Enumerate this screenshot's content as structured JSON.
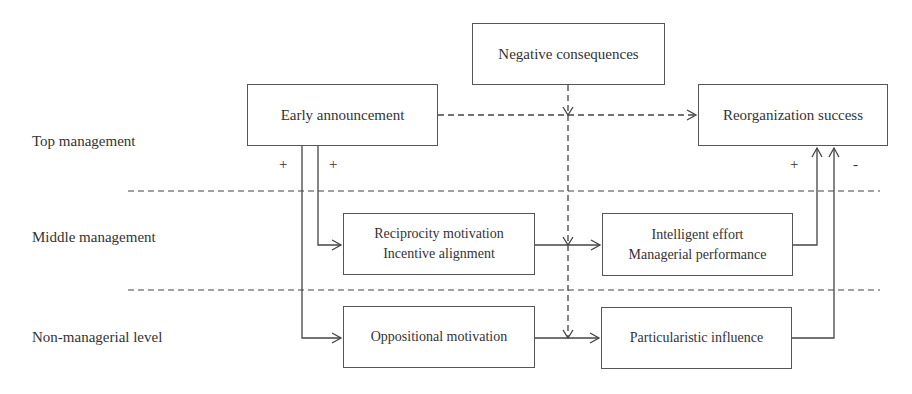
{
  "levels": {
    "top": "Top management",
    "middle": "Middle management",
    "non_managerial": "Non-managerial level"
  },
  "nodes": {
    "negative_consequences": {
      "line1": "Negative consequences"
    },
    "early_announcement": {
      "line1": "Early announcement"
    },
    "reorganization_success": {
      "line1": "Reorganization success"
    },
    "reciprocity": {
      "line1": "Reciprocity motivation",
      "line2": "Incentive alignment"
    },
    "intelligent_effort": {
      "line1": "Intelligent effort",
      "line2": "Managerial performance"
    },
    "oppositional": {
      "line1": "Oppositional motivation"
    },
    "particularistic": {
      "line1": "Particularistic influence"
    }
  },
  "signs": {
    "early_to_nonmanagerial": "+",
    "early_to_middle": "+",
    "intelligent_to_success": "+",
    "particularistic_to_success": "-"
  },
  "edges": [
    {
      "from": "early_announcement",
      "to": "reorganization_success",
      "style": "dashed"
    },
    {
      "from": "negative_consequences",
      "to": "moderates all horizontal links",
      "style": "dashed"
    },
    {
      "from": "early_announcement",
      "to": "reciprocity",
      "sign": "+"
    },
    {
      "from": "early_announcement",
      "to": "oppositional",
      "sign": "+"
    },
    {
      "from": "reciprocity",
      "to": "intelligent_effort"
    },
    {
      "from": "oppositional",
      "to": "particularistic"
    },
    {
      "from": "intelligent_effort",
      "to": "reorganization_success",
      "sign": "+"
    },
    {
      "from": "particularistic",
      "to": "reorganization_success",
      "sign": "-"
    }
  ]
}
